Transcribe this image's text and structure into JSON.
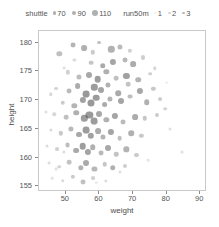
{
  "chart_data": {
    "type": "scatter",
    "title": "",
    "xlabel": "weight",
    "ylabel": "height",
    "xlim": [
      42,
      92
    ],
    "ylim": [
      154,
      182
    ],
    "xticks": [
      50,
      60,
      70,
      80,
      90
    ],
    "yticks": [
      155,
      160,
      165,
      170,
      175,
      180
    ],
    "grid": false,
    "legend_position": "top-center",
    "size_legend": {
      "title": "shuttle",
      "entries": [
        {
          "label": "70",
          "marker_px": 3.2
        },
        {
          "label": "90",
          "marker_px": 4.4
        },
        {
          "label": "110",
          "marker_px": 5.6
        }
      ]
    },
    "alpha_legend": {
      "title": "run50m",
      "entries": [
        {
          "label": "1",
          "opacity": 0.18
        },
        {
          "label": "2",
          "opacity": 0.32
        },
        {
          "label": "3",
          "opacity": 0.55
        }
      ]
    },
    "point_color": "#4a4a4a",
    "points": [
      {
        "weight": 48.0,
        "height": 178.0,
        "shuttle": 92,
        "run50m": 1.6
      },
      {
        "weight": 52.0,
        "height": 179.5,
        "shuttle": 88,
        "run50m": 2.0
      },
      {
        "weight": 55.5,
        "height": 179.0,
        "shuttle": 96,
        "run50m": 2.2
      },
      {
        "weight": 58.0,
        "height": 178.3,
        "shuttle": 84,
        "run50m": 1.2
      },
      {
        "weight": 60.0,
        "height": 180.0,
        "shuttle": 78,
        "run50m": 1.5
      },
      {
        "weight": 63.5,
        "height": 178.8,
        "shuttle": 102,
        "run50m": 2.1
      },
      {
        "weight": 66.0,
        "height": 179.2,
        "shuttle": 90,
        "run50m": 1.8
      },
      {
        "weight": 57.5,
        "height": 176.5,
        "shuttle": 86,
        "run50m": 1.4
      },
      {
        "weight": 61.0,
        "height": 176.0,
        "shuttle": 94,
        "run50m": 2.4
      },
      {
        "weight": 64.0,
        "height": 176.6,
        "shuttle": 100,
        "run50m": 2.6
      },
      {
        "weight": 67.5,
        "height": 177.0,
        "shuttle": 88,
        "run50m": 1.9
      },
      {
        "weight": 70.0,
        "height": 176.2,
        "shuttle": 96,
        "run50m": 2.3
      },
      {
        "weight": 73.0,
        "height": 177.4,
        "shuttle": 80,
        "run50m": 1.1
      },
      {
        "weight": 50.5,
        "height": 174.8,
        "shuttle": 82,
        "run50m": 1.0
      },
      {
        "weight": 54.0,
        "height": 174.0,
        "shuttle": 90,
        "run50m": 1.7
      },
      {
        "weight": 57.0,
        "height": 174.4,
        "shuttle": 98,
        "run50m": 2.5
      },
      {
        "weight": 59.5,
        "height": 173.6,
        "shuttle": 104,
        "run50m": 2.8
      },
      {
        "weight": 62.0,
        "height": 174.9,
        "shuttle": 92,
        "run50m": 2.2
      },
      {
        "weight": 65.0,
        "height": 173.8,
        "shuttle": 86,
        "run50m": 1.6
      },
      {
        "weight": 68.0,
        "height": 174.2,
        "shuttle": 100,
        "run50m": 2.7
      },
      {
        "weight": 71.5,
        "height": 173.5,
        "shuttle": 94,
        "run50m": 2.0
      },
      {
        "weight": 75.0,
        "height": 174.6,
        "shuttle": 76,
        "run50m": 1.0
      },
      {
        "weight": 47.0,
        "height": 172.0,
        "shuttle": 78,
        "run50m": 0.9
      },
      {
        "weight": 51.0,
        "height": 171.5,
        "shuttle": 88,
        "run50m": 1.8
      },
      {
        "weight": 53.5,
        "height": 172.4,
        "shuttle": 96,
        "run50m": 2.3
      },
      {
        "weight": 56.0,
        "height": 171.0,
        "shuttle": 106,
        "run50m": 3.0
      },
      {
        "weight": 58.5,
        "height": 172.2,
        "shuttle": 102,
        "run50m": 2.9
      },
      {
        "weight": 60.5,
        "height": 171.8,
        "shuttle": 98,
        "run50m": 2.6
      },
      {
        "weight": 62.5,
        "height": 172.6,
        "shuttle": 90,
        "run50m": 2.1
      },
      {
        "weight": 65.5,
        "height": 171.2,
        "shuttle": 94,
        "run50m": 2.4
      },
      {
        "weight": 68.5,
        "height": 172.8,
        "shuttle": 86,
        "run50m": 1.5
      },
      {
        "weight": 72.0,
        "height": 171.6,
        "shuttle": 100,
        "run50m": 2.5
      },
      {
        "weight": 76.0,
        "height": 172.0,
        "shuttle": 82,
        "run50m": 1.3
      },
      {
        "weight": 49.0,
        "height": 169.5,
        "shuttle": 84,
        "run50m": 1.2
      },
      {
        "weight": 52.5,
        "height": 169.0,
        "shuttle": 92,
        "run50m": 2.0
      },
      {
        "weight": 55.0,
        "height": 170.0,
        "shuttle": 100,
        "run50m": 2.7
      },
      {
        "weight": 57.5,
        "height": 169.4,
        "shuttle": 108,
        "run50m": 3.0
      },
      {
        "weight": 59.0,
        "height": 170.4,
        "shuttle": 104,
        "run50m": 2.9
      },
      {
        "weight": 61.5,
        "height": 169.2,
        "shuttle": 96,
        "run50m": 2.4
      },
      {
        "weight": 63.0,
        "height": 170.2,
        "shuttle": 90,
        "run50m": 2.0
      },
      {
        "weight": 66.5,
        "height": 169.8,
        "shuttle": 98,
        "run50m": 2.6
      },
      {
        "weight": 69.0,
        "height": 170.6,
        "shuttle": 88,
        "run50m": 1.7
      },
      {
        "weight": 74.0,
        "height": 169.6,
        "shuttle": 94,
        "run50m": 2.2
      },
      {
        "weight": 78.0,
        "height": 170.2,
        "shuttle": 78,
        "run50m": 1.1
      },
      {
        "weight": 46.5,
        "height": 167.5,
        "shuttle": 74,
        "run50m": 0.8
      },
      {
        "weight": 50.0,
        "height": 167.0,
        "shuttle": 86,
        "run50m": 1.6
      },
      {
        "weight": 53.0,
        "height": 167.8,
        "shuttle": 94,
        "run50m": 2.2
      },
      {
        "weight": 55.5,
        "height": 166.8,
        "shuttle": 102,
        "run50m": 2.8
      },
      {
        "weight": 57.0,
        "height": 167.4,
        "shuttle": 110,
        "run50m": 3.0
      },
      {
        "weight": 58.5,
        "height": 166.4,
        "shuttle": 106,
        "run50m": 2.9
      },
      {
        "weight": 60.0,
        "height": 167.6,
        "shuttle": 98,
        "run50m": 2.5
      },
      {
        "weight": 62.0,
        "height": 166.6,
        "shuttle": 92,
        "run50m": 2.1
      },
      {
        "weight": 64.5,
        "height": 167.2,
        "shuttle": 100,
        "run50m": 2.6
      },
      {
        "weight": 67.0,
        "height": 166.2,
        "shuttle": 88,
        "run50m": 1.8
      },
      {
        "weight": 70.5,
        "height": 167.0,
        "shuttle": 96,
        "run50m": 2.3
      },
      {
        "weight": 73.5,
        "height": 166.8,
        "shuttle": 84,
        "run50m": 1.4
      },
      {
        "weight": 77.0,
        "height": 167.4,
        "shuttle": 80,
        "run50m": 1.2
      },
      {
        "weight": 45.5,
        "height": 164.8,
        "shuttle": 72,
        "run50m": 0.7
      },
      {
        "weight": 48.5,
        "height": 164.2,
        "shuttle": 82,
        "run50m": 1.3
      },
      {
        "weight": 51.5,
        "height": 165.0,
        "shuttle": 90,
        "run50m": 1.9
      },
      {
        "weight": 54.0,
        "height": 164.0,
        "shuttle": 98,
        "run50m": 2.5
      },
      {
        "weight": 56.0,
        "height": 164.8,
        "shuttle": 106,
        "run50m": 2.9
      },
      {
        "weight": 57.5,
        "height": 163.8,
        "shuttle": 102,
        "run50m": 2.7
      },
      {
        "weight": 59.5,
        "height": 164.6,
        "shuttle": 96,
        "run50m": 2.3
      },
      {
        "weight": 61.0,
        "height": 163.6,
        "shuttle": 90,
        "run50m": 2.0
      },
      {
        "weight": 63.5,
        "height": 164.4,
        "shuttle": 100,
        "run50m": 2.6
      },
      {
        "weight": 66.0,
        "height": 163.4,
        "shuttle": 86,
        "run50m": 1.6
      },
      {
        "weight": 69.5,
        "height": 164.2,
        "shuttle": 94,
        "run50m": 2.2
      },
      {
        "weight": 72.5,
        "height": 163.8,
        "shuttle": 82,
        "run50m": 1.3
      },
      {
        "weight": 44.5,
        "height": 162.0,
        "shuttle": 70,
        "run50m": 0.6
      },
      {
        "weight": 47.5,
        "height": 161.4,
        "shuttle": 78,
        "run50m": 1.0
      },
      {
        "weight": 50.5,
        "height": 162.2,
        "shuttle": 88,
        "run50m": 1.7
      },
      {
        "weight": 53.0,
        "height": 161.2,
        "shuttle": 96,
        "run50m": 2.4
      },
      {
        "weight": 55.0,
        "height": 162.0,
        "shuttle": 104,
        "run50m": 2.8
      },
      {
        "weight": 56.5,
        "height": 161.0,
        "shuttle": 100,
        "run50m": 2.6
      },
      {
        "weight": 58.0,
        "height": 161.8,
        "shuttle": 94,
        "run50m": 2.2
      },
      {
        "weight": 60.5,
        "height": 160.8,
        "shuttle": 88,
        "run50m": 1.8
      },
      {
        "weight": 62.5,
        "height": 161.6,
        "shuttle": 98,
        "run50m": 2.5
      },
      {
        "weight": 65.0,
        "height": 160.6,
        "shuttle": 84,
        "run50m": 1.5
      },
      {
        "weight": 68.0,
        "height": 161.4,
        "shuttle": 92,
        "run50m": 2.0
      },
      {
        "weight": 71.0,
        "height": 160.4,
        "shuttle": 80,
        "run50m": 1.2
      },
      {
        "weight": 45.0,
        "height": 159.0,
        "shuttle": 68,
        "run50m": 0.5
      },
      {
        "weight": 48.0,
        "height": 158.4,
        "shuttle": 76,
        "run50m": 0.9
      },
      {
        "weight": 51.0,
        "height": 159.2,
        "shuttle": 86,
        "run50m": 1.5
      },
      {
        "weight": 54.5,
        "height": 158.2,
        "shuttle": 92,
        "run50m": 2.1
      },
      {
        "weight": 56.0,
        "height": 159.0,
        "shuttle": 98,
        "run50m": 2.4
      },
      {
        "weight": 58.5,
        "height": 158.0,
        "shuttle": 90,
        "run50m": 1.9
      },
      {
        "weight": 61.5,
        "height": 158.8,
        "shuttle": 84,
        "run50m": 1.4
      },
      {
        "weight": 64.0,
        "height": 158.2,
        "shuttle": 94,
        "run50m": 2.2
      },
      {
        "weight": 67.5,
        "height": 158.6,
        "shuttle": 80,
        "run50m": 1.1
      },
      {
        "weight": 46.0,
        "height": 156.4,
        "shuttle": 66,
        "run50m": 0.4
      },
      {
        "weight": 49.0,
        "height": 156.0,
        "shuttle": 74,
        "run50m": 0.7
      },
      {
        "weight": 52.0,
        "height": 156.6,
        "shuttle": 82,
        "run50m": 1.2
      },
      {
        "weight": 55.0,
        "height": 155.8,
        "shuttle": 88,
        "run50m": 1.6
      },
      {
        "weight": 58.0,
        "height": 156.4,
        "shuttle": 78,
        "run50m": 1.0
      },
      {
        "weight": 62.0,
        "height": 156.0,
        "shuttle": 72,
        "run50m": 0.6
      },
      {
        "weight": 79.5,
        "height": 168.5,
        "shuttle": 76,
        "run50m": 0.9
      },
      {
        "weight": 81.0,
        "height": 165.0,
        "shuttle": 70,
        "run50m": 0.5
      },
      {
        "weight": 84.5,
        "height": 161.0,
        "shuttle": 68,
        "run50m": 0.4
      },
      {
        "weight": 76.5,
        "height": 175.5,
        "shuttle": 74,
        "run50m": 0.8
      },
      {
        "weight": 80.0,
        "height": 173.0,
        "shuttle": 66,
        "run50m": 0.3
      },
      {
        "weight": 69.0,
        "height": 178.5,
        "shuttle": 82,
        "run50m": 1.0
      },
      {
        "weight": 44.0,
        "height": 168.0,
        "shuttle": 70,
        "run50m": 0.5
      },
      {
        "weight": 45.5,
        "height": 171.0,
        "shuttle": 74,
        "run50m": 0.7
      },
      {
        "weight": 47.0,
        "height": 158.0,
        "shuttle": 68,
        "run50m": 0.4
      },
      {
        "weight": 49.5,
        "height": 161.0,
        "shuttle": 72,
        "run50m": 0.6
      },
      {
        "weight": 66.0,
        "height": 157.5,
        "shuttle": 70,
        "run50m": 0.5
      },
      {
        "weight": 74.5,
        "height": 159.5,
        "shuttle": 66,
        "run50m": 0.3
      },
      {
        "weight": 59.0,
        "height": 155.6,
        "shuttle": 64,
        "run50m": 0.3
      },
      {
        "weight": 52.5,
        "height": 177.0,
        "shuttle": 72,
        "run50m": 0.6
      },
      {
        "weight": 49.5,
        "height": 175.5,
        "shuttle": 68,
        "run50m": 0.4
      }
    ]
  }
}
